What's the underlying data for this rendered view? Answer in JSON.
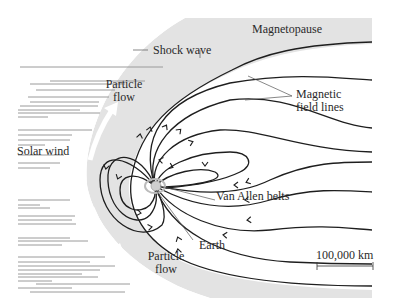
{
  "labels": {
    "shock_wave": "Shock wave",
    "magnetopause": "Magnetopause",
    "magnetic_field_lines_1": "Magnetic",
    "magnetic_field_lines_2": "field lines",
    "particle_flow_top_1": "Particle",
    "particle_flow_top_2": "flow",
    "particle_flow_bottom_1": "Particle",
    "particle_flow_bottom_2": "flow",
    "solar_wind": "Solar wind",
    "van_allen_belts": "Van Allen belts",
    "earth": "Earth",
    "scale_bar": "100,000 km"
  },
  "colors": {
    "sheath": "#e3e3e3",
    "field_line": "#1e1e1e",
    "streak": "#9a9a9a",
    "text": "#2a2a2a"
  }
}
